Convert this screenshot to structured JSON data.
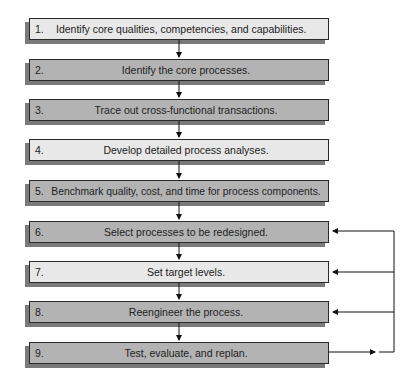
{
  "diagram": {
    "type": "flowchart",
    "steps": [
      {
        "num": "1.",
        "label": "Identify core qualities, competencies, and capabilities.",
        "shade": "light"
      },
      {
        "num": "2.",
        "label": "Identify the core processes.",
        "shade": "dark"
      },
      {
        "num": "3.",
        "label": "Trace out cross-functional transactions.",
        "shade": "dark"
      },
      {
        "num": "4.",
        "label": "Develop detailed process analyses.",
        "shade": "light"
      },
      {
        "num": "5.",
        "label": "Benchmark quality, cost, and time for process components.",
        "shade": "dark"
      },
      {
        "num": "6.",
        "label": "Select processes to be redesigned.",
        "shade": "dark"
      },
      {
        "num": "7.",
        "label": "Set target levels.",
        "shade": "light"
      },
      {
        "num": "8.",
        "label": "Reengineer the process.",
        "shade": "dark"
      },
      {
        "num": "9.",
        "label": "Test, evaluate, and replan.",
        "shade": "dark"
      }
    ],
    "flow": "sequential top-to-bottom arrows between steps 1 through 9",
    "feedback_loop": {
      "from": "9",
      "to": [
        "6",
        "7",
        "8"
      ]
    },
    "colors": {
      "light_box": "#e8e8e8",
      "dark_box": "#b3b3b3",
      "border": "#2a2a2a",
      "shadow": "#7a7a7a"
    }
  }
}
